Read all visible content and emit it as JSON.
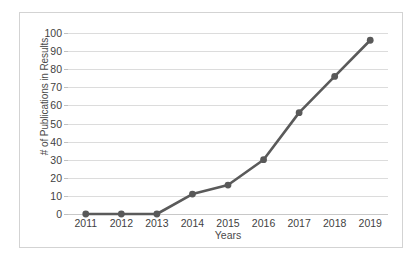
{
  "chart_data": {
    "type": "line",
    "title": "",
    "xlabel": "Years",
    "ylabel": "# of Publications in Results",
    "categories": [
      "2011",
      "2012",
      "2013",
      "2014",
      "2015",
      "2016",
      "2017",
      "2018",
      "2019"
    ],
    "values": [
      0,
      0,
      0,
      11,
      16,
      30,
      56,
      76,
      96
    ],
    "series": [
      {
        "name": "# of Publications in Results",
        "values": [
          0,
          0,
          0,
          11,
          16,
          30,
          56,
          76,
          96
        ]
      }
    ],
    "ylim": [
      0,
      100
    ],
    "y_ticks": [
      0,
      10,
      20,
      30,
      40,
      50,
      60,
      70,
      80,
      90,
      100
    ],
    "y_tick_labels": [
      "0",
      "10",
      "20",
      "30",
      "40",
      "50",
      "60",
      "70",
      "80",
      "90",
      "100"
    ],
    "grid": true,
    "grid_axis": "y",
    "legend": false,
    "legend_position": "none",
    "marker": "circle",
    "colors": {
      "line": "#5a5a5a",
      "marker": "#595959",
      "gridline": "#dcdcdc",
      "border": "#d3d3d3",
      "background": "#ffffff",
      "text": "#3f3f3f"
    }
  }
}
